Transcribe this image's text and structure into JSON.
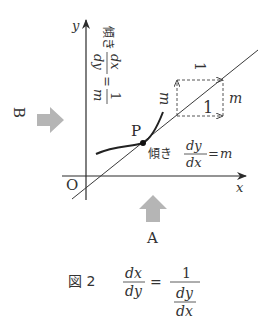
{
  "figure": {
    "axes": {
      "x_label": "x",
      "y_label": "y",
      "origin_label": "O"
    },
    "point_label": "P",
    "arrows": {
      "left_label": "B",
      "bottom_label": "A",
      "arrow_color": "#b5b5b5"
    },
    "slope_label_horizontal": {
      "prefix": "傾き",
      "numerator": "dy",
      "denominator": "dx",
      "equals": "=",
      "value": "m"
    },
    "slope_label_rotated": {
      "prefix": "傾き",
      "numerator": "dx",
      "denominator": "dy",
      "equals": "=",
      "value_numerator": "1",
      "value_denominator": "m"
    },
    "triangle": {
      "horizontal_run": "1",
      "vertical_rise": "m",
      "rotated_run": "1",
      "rotated_rise": "m"
    },
    "caption": {
      "label": "図 2",
      "lhs_numerator": "dx",
      "lhs_denominator": "dy",
      "equals": "=",
      "rhs_numerator": "1",
      "rhs_inner_numerator": "dy",
      "rhs_inner_denominator": "dx"
    },
    "colors": {
      "ink": "#2b2b2b",
      "line": "#3a3a3a",
      "dashed": "#555555"
    }
  }
}
